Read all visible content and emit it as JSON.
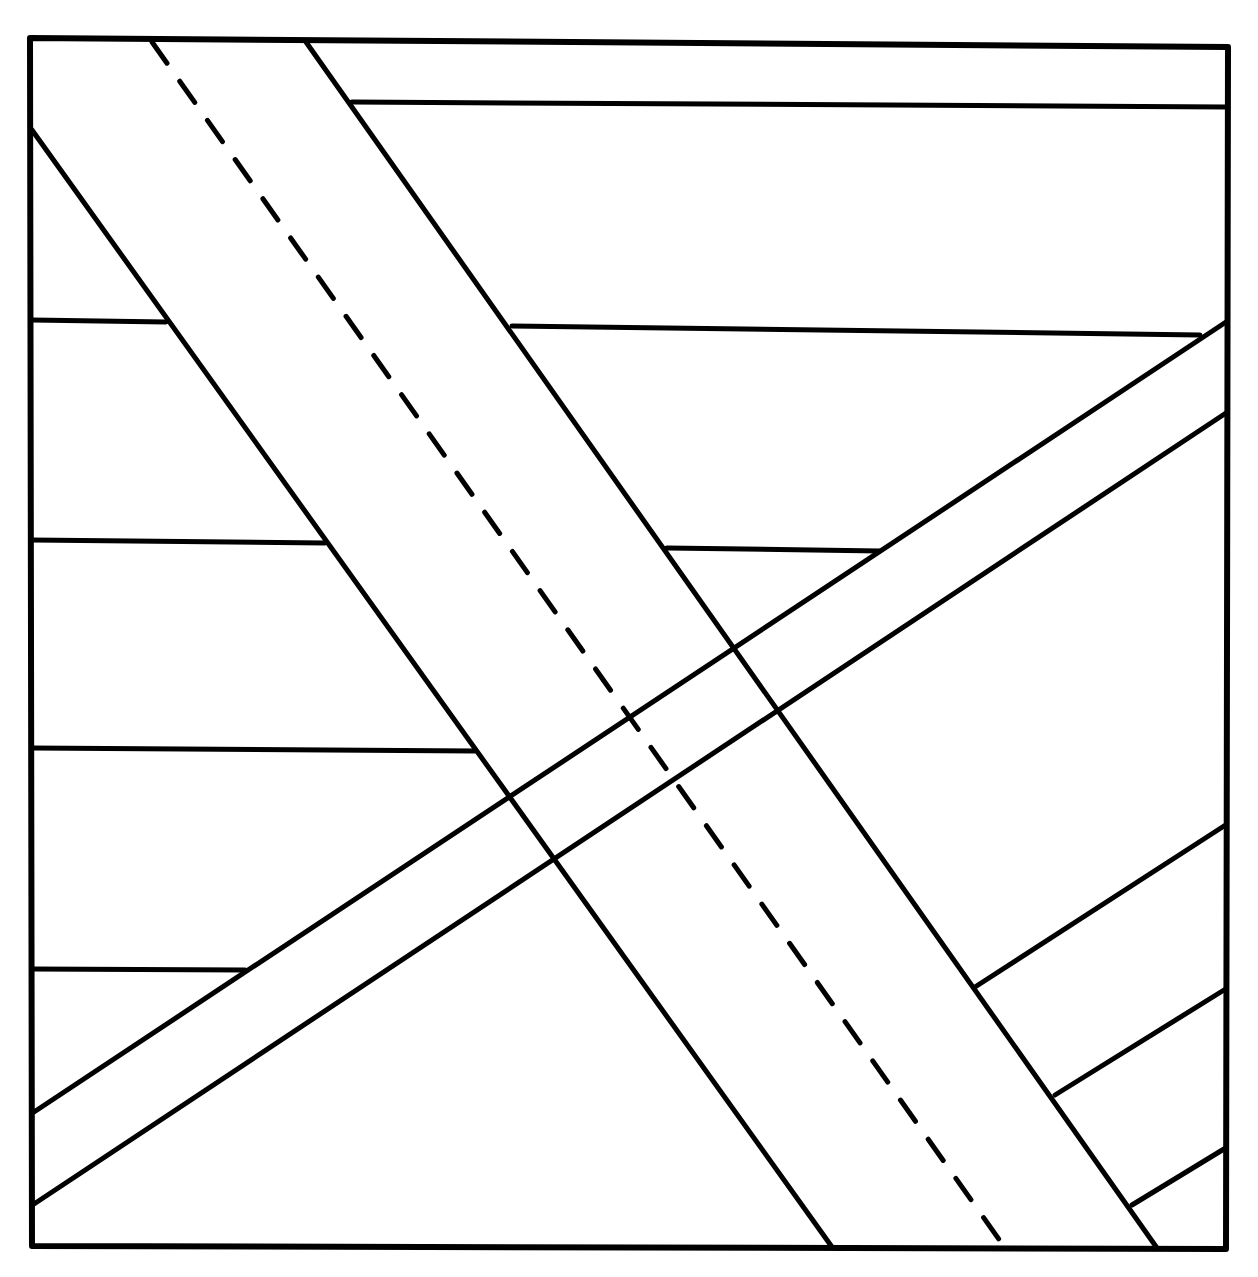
{
  "diagram": {
    "frame": {
      "points": [
        [
          30,
          38
        ],
        [
          1228,
          47
        ],
        [
          1226,
          1249
        ],
        [
          32,
          1246
        ]
      ]
    },
    "dike_main": {
      "left_edge": [
        [
          32,
          130
        ],
        [
          832,
          1247
        ]
      ],
      "right_edge": [
        [
          306,
          42
        ],
        [
          1157,
          1248
        ]
      ],
      "center_dashed": [
        [
          152,
          42
        ],
        [
          1003,
          1245
        ]
      ]
    },
    "dike_secondary": {
      "upper_edge": [
        [
          34,
          1112
        ],
        [
          1226,
          322
        ]
      ],
      "lower_edge": [
        [
          34,
          1204
        ],
        [
          1226,
          413
        ]
      ]
    },
    "strata_lines": [
      [
        [
          352,
          102
        ],
        [
          1226,
          107
        ]
      ],
      [
        [
          32,
          320
        ],
        [
          166,
          322
        ]
      ],
      [
        [
          512,
          326
        ],
        [
          1200,
          335
        ]
      ],
      [
        [
          32,
          540
        ],
        [
          325,
          543
        ]
      ],
      [
        [
          667,
          548
        ],
        [
          880,
          551
        ]
      ],
      [
        [
          32,
          748
        ],
        [
          475,
          751
        ]
      ],
      [
        [
          32,
          969
        ],
        [
          245,
          970
        ]
      ],
      [
        [
          975,
          987
        ],
        [
          1224,
          826
        ]
      ],
      [
        [
          1055,
          1095
        ],
        [
          1224,
          990
        ]
      ],
      [
        [
          1132,
          1205
        ],
        [
          1224,
          1149
        ]
      ]
    ]
  }
}
